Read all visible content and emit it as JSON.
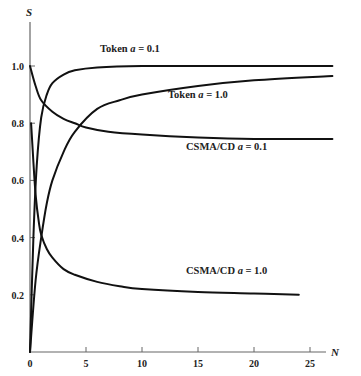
{
  "chart_data": {
    "type": "line",
    "title": "",
    "xlabel": "N",
    "ylabel": "S",
    "xlim": [
      0,
      27
    ],
    "ylim": [
      0,
      1.1
    ],
    "x_ticks": [
      0,
      5,
      10,
      15,
      20,
      25
    ],
    "y_ticks": [
      0.2,
      0.4,
      0.6,
      0.8,
      1.0
    ],
    "x_tick_labels": [
      "0",
      "5",
      "10",
      "15",
      "20",
      "25"
    ],
    "y_tick_labels": [
      "0.2",
      "0.4",
      "0.6",
      "0.8",
      "1.0"
    ],
    "grid": false,
    "legend": "inline labels",
    "series": [
      {
        "name": "Token a = 0.1",
        "x": [
          0,
          0.3,
          0.6,
          1,
          1.5,
          2,
          3,
          4,
          6,
          10,
          15,
          20,
          27
        ],
        "values": [
          0,
          0.4,
          0.65,
          0.82,
          0.9,
          0.94,
          0.97,
          0.985,
          0.995,
          1.0,
          1.0,
          1.0,
          1.0
        ],
        "label_pos": [
          100,
          52
        ]
      },
      {
        "name": "Token a = 1.0",
        "x": [
          0,
          0.5,
          1,
          1.5,
          2,
          3,
          4,
          6,
          8,
          10,
          15,
          20,
          27
        ],
        "values": [
          0,
          0.25,
          0.4,
          0.52,
          0.6,
          0.7,
          0.77,
          0.85,
          0.88,
          0.9,
          0.93,
          0.95,
          0.965
        ],
        "label_pos": [
          168,
          98
        ]
      },
      {
        "name": "CSMA/CD a = 0.1",
        "x": [
          0,
          0.5,
          1,
          2,
          3,
          4,
          5,
          7,
          10,
          15,
          20,
          27
        ],
        "values": [
          1.0,
          0.93,
          0.88,
          0.84,
          0.815,
          0.8,
          0.785,
          0.77,
          0.76,
          0.75,
          0.745,
          0.745
        ],
        "label_pos": [
          186,
          150
        ]
      },
      {
        "name": "CSMA/CD a = 1.0",
        "x": [
          0.1,
          0.25,
          0.5,
          0.8,
          1,
          1.5,
          2,
          3,
          4,
          6,
          8,
          10,
          15,
          20,
          24
        ],
        "values": [
          0.8,
          0.7,
          0.55,
          0.45,
          0.41,
          0.36,
          0.33,
          0.29,
          0.27,
          0.245,
          0.23,
          0.22,
          0.21,
          0.205,
          0.2
        ],
        "label_pos": [
          186,
          274
        ]
      }
    ]
  }
}
